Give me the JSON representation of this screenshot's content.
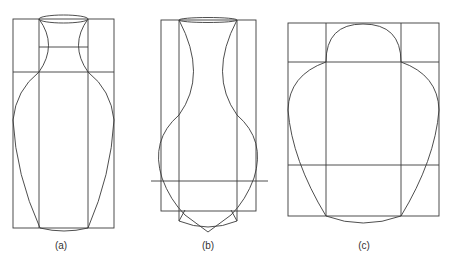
{
  "figure": {
    "panels": [
      {
        "id": "a",
        "label": "(a)",
        "description": "Slender vase inscribed in rectangle grid"
      },
      {
        "id": "b",
        "label": "(b)",
        "description": "Bulbous vase with narrow neck and pointed base construction"
      },
      {
        "id": "c",
        "label": "(c)",
        "description": "Wide ovoid vase with dome top in 3x3 grid"
      }
    ]
  }
}
